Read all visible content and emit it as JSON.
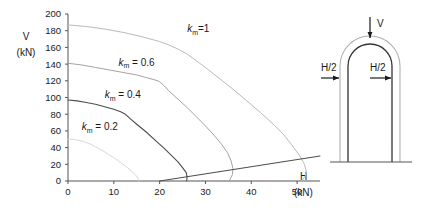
{
  "chart_data": {
    "type": "line",
    "title": "",
    "xlabel": "H",
    "xunit": "(kN)",
    "ylabel": "V",
    "yunit": "(kN)",
    "xlim": [
      0,
      55
    ],
    "ylim": [
      0,
      200
    ],
    "xticks": [
      "0",
      "10",
      "20",
      "30",
      "40",
      "50"
    ],
    "xtick_values": [
      0,
      10,
      20,
      30,
      40,
      50
    ],
    "yticks": [
      "0",
      "20",
      "40",
      "60",
      "80",
      "100",
      "120",
      "140",
      "160",
      "180",
      "200"
    ],
    "ytick_values": [
      0,
      20,
      40,
      60,
      80,
      100,
      120,
      140,
      160,
      180,
      200
    ],
    "grid": false,
    "legend": "inline-curve-labels",
    "series": [
      {
        "name": "km_1",
        "label_prefix": "k",
        "label_sub": "m",
        "label_suffix": "=1",
        "label_x": 26,
        "label_y": 178,
        "color": "#b9b9b9",
        "points": [
          [
            0,
            187
          ],
          [
            4,
            185
          ],
          [
            8,
            182
          ],
          [
            12,
            178
          ],
          [
            16,
            173
          ],
          [
            20,
            167
          ],
          [
            22,
            163
          ],
          [
            24,
            158
          ],
          [
            26,
            152
          ],
          [
            28,
            144
          ],
          [
            30,
            136
          ],
          [
            33,
            123
          ],
          [
            36,
            110
          ],
          [
            39,
            96
          ],
          [
            42,
            82
          ],
          [
            45,
            67
          ],
          [
            47,
            56
          ],
          [
            49,
            42
          ],
          [
            50.6,
            30
          ],
          [
            51.6,
            20
          ],
          [
            52,
            12
          ],
          [
            51.8,
            6
          ],
          [
            51,
            0
          ]
        ]
      },
      {
        "name": "km_06",
        "label_prefix": "k",
        "label_sub": "m",
        "label_suffix": " = 0.6",
        "label_x": 11,
        "label_y": 138,
        "color": "#a3a3a3",
        "points": [
          [
            0,
            141
          ],
          [
            3,
            139
          ],
          [
            6,
            136
          ],
          [
            9,
            133
          ],
          [
            12,
            130
          ],
          [
            15,
            127
          ],
          [
            17,
            124
          ],
          [
            19,
            121
          ],
          [
            20,
            119
          ],
          [
            21,
            114
          ],
          [
            22,
            108
          ],
          [
            24,
            98
          ],
          [
            26,
            88
          ],
          [
            28,
            77
          ],
          [
            30,
            66
          ],
          [
            32,
            54
          ],
          [
            33.5,
            44
          ],
          [
            34.8,
            34
          ],
          [
            35.6,
            24
          ],
          [
            36,
            15
          ],
          [
            35.9,
            8
          ],
          [
            35.2,
            0
          ]
        ]
      },
      {
        "name": "km_04",
        "label_prefix": "k",
        "label_sub": "m",
        "label_suffix": " = 0.4",
        "label_x": 8,
        "label_y": 99,
        "color": "#4d4d4d",
        "points": [
          [
            0,
            97
          ],
          [
            2,
            96
          ],
          [
            4,
            94
          ],
          [
            6,
            92
          ],
          [
            8,
            89
          ],
          [
            10,
            86
          ],
          [
            11.5,
            83
          ],
          [
            12.5,
            80
          ],
          [
            13.5,
            75
          ],
          [
            15,
            68
          ],
          [
            17,
            59
          ],
          [
            19,
            49
          ],
          [
            21,
            39
          ],
          [
            22.5,
            31
          ],
          [
            24,
            23
          ],
          [
            25,
            16
          ],
          [
            25.8,
            10
          ],
          [
            26,
            5
          ],
          [
            25.9,
            0
          ]
        ]
      },
      {
        "name": "km_02",
        "label_prefix": "k",
        "label_sub": "m",
        "label_suffix": " = 0.2",
        "label_x": 3,
        "label_y": 61,
        "color": "#d8d8d8",
        "points": [
          [
            0,
            50
          ],
          [
            1,
            50
          ],
          [
            2,
            49
          ],
          [
            3,
            48
          ],
          [
            4,
            46
          ],
          [
            5,
            44
          ],
          [
            6,
            41
          ],
          [
            7,
            38
          ],
          [
            8,
            35
          ],
          [
            9,
            31
          ],
          [
            10,
            28
          ],
          [
            11,
            24
          ],
          [
            12,
            20
          ],
          [
            13,
            16
          ],
          [
            14,
            11
          ],
          [
            14.8,
            7
          ],
          [
            15.3,
            3
          ],
          [
            15.5,
            0
          ]
        ]
      },
      {
        "name": "limit-line",
        "label_prefix": "",
        "label_sub": "",
        "label_suffix": "",
        "color": "#4d4d4d",
        "points": [
          [
            20,
            0
          ],
          [
            55,
            30
          ]
        ]
      }
    ]
  },
  "figure": {
    "name": "arch-free-body-diagram",
    "load_v_label": "V",
    "load_h_left_label": "H/2",
    "load_h_right_label": "H/2"
  }
}
